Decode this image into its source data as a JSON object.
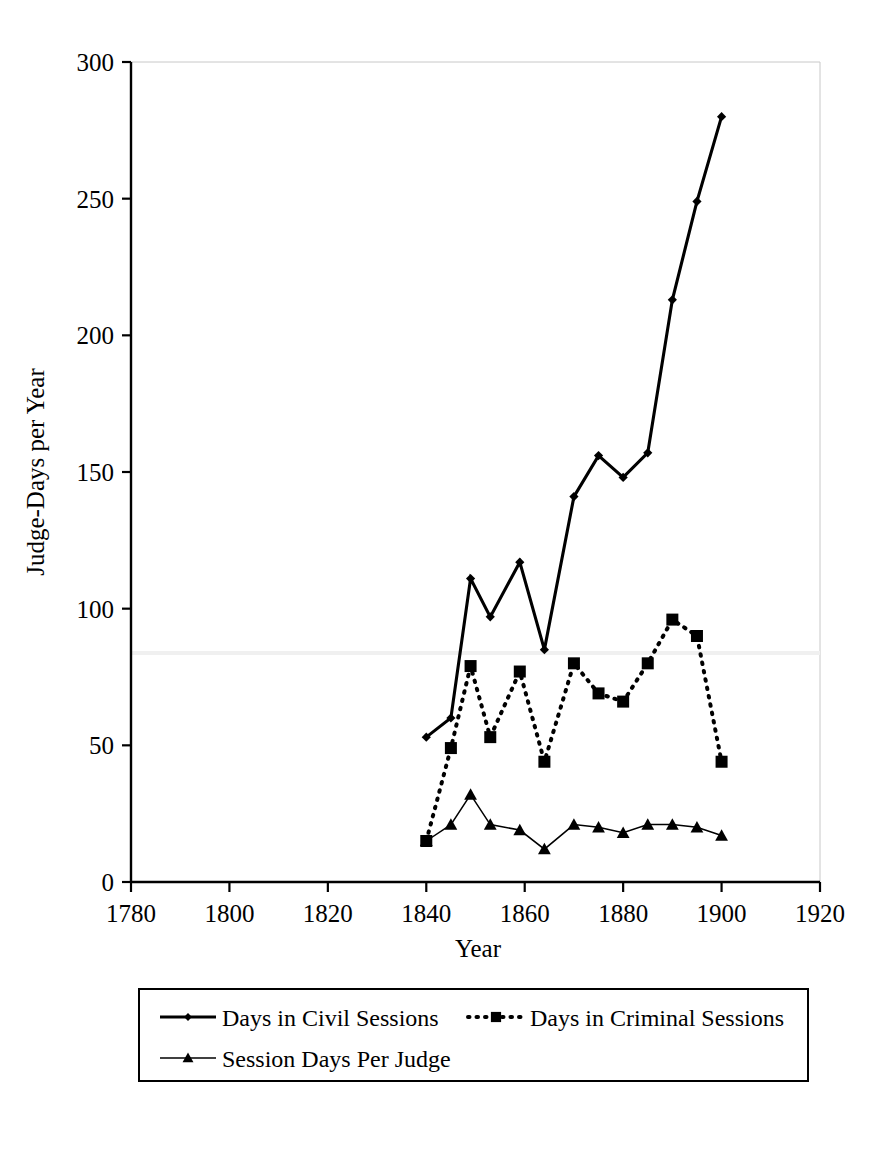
{
  "chart_data": {
    "type": "line",
    "title": "",
    "xlabel": "Year",
    "ylabel": "Judge-Days per Year",
    "xlim": [
      1780,
      1920
    ],
    "ylim": [
      0,
      300
    ],
    "xticks": [
      1780,
      1800,
      1820,
      1840,
      1860,
      1880,
      1900,
      1920
    ],
    "yticks": [
      0,
      50,
      100,
      150,
      200,
      250,
      300
    ],
    "grid": false,
    "legend_position": "bottom",
    "series": [
      {
        "name": "Days in Civil Sessions",
        "marker": "diamond",
        "line_style": "solid-thick",
        "x": [
          1840,
          1845,
          1849,
          1853,
          1859,
          1864,
          1870,
          1875,
          1880,
          1885,
          1890,
          1895,
          1900
        ],
        "values": [
          53,
          60,
          111,
          97,
          117,
          85,
          141,
          156,
          148,
          157,
          213,
          249,
          280
        ]
      },
      {
        "name": "Days in Criminal Sessions",
        "marker": "square",
        "line_style": "dotted",
        "x": [
          1840,
          1845,
          1849,
          1853,
          1859,
          1864,
          1870,
          1875,
          1880,
          1885,
          1890,
          1895,
          1900
        ],
        "values": [
          15,
          49,
          79,
          53,
          77,
          44,
          80,
          69,
          66,
          80,
          96,
          90,
          44
        ]
      },
      {
        "name": "Session Days Per Judge",
        "marker": "triangle",
        "line_style": "solid-thin",
        "x": [
          1840,
          1845,
          1849,
          1853,
          1859,
          1864,
          1870,
          1875,
          1880,
          1885,
          1890,
          1895,
          1900
        ],
        "values": [
          15,
          21,
          32,
          21,
          19,
          12,
          21,
          20,
          18,
          21,
          21,
          20,
          17
        ]
      }
    ]
  },
  "axes": {
    "y_title": "Judge-Days per Year",
    "x_title": "Year",
    "y_tick_labels": [
      "300",
      "250",
      "200",
      "150",
      "100",
      "50",
      "0"
    ],
    "x_tick_labels": [
      "1780",
      "1800",
      "1820",
      "1840",
      "1860",
      "1880",
      "1900",
      "1920"
    ]
  },
  "legend": {
    "entries": [
      {
        "label": "Days in Civil Sessions",
        "marker": "diamond",
        "style": "solid-thick"
      },
      {
        "label": "Days in Criminal Sessions",
        "marker": "square",
        "style": "dotted"
      },
      {
        "label": "Session Days Per Judge",
        "marker": "triangle",
        "style": "solid-thin"
      }
    ]
  },
  "colors": {
    "ink": "#000000",
    "background": "#ffffff",
    "frame": "#c8c8c8"
  }
}
